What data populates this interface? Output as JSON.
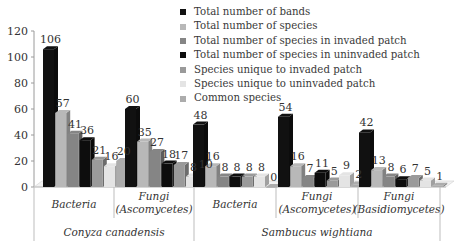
{
  "chart_data": {
    "type": "bar",
    "style": "3d-clustered-column",
    "title": "",
    "xlabel": "",
    "ylabel": "",
    "ylim": [
      0,
      120
    ],
    "yticks": [
      0,
      20,
      40,
      60,
      80,
      100,
      120
    ],
    "grid": false,
    "legend_position": "top-right",
    "group_levels": [
      {
        "label": "Conyza canadensis",
        "categories": [
          "Bacteria",
          "Fungi (Ascomycetes)"
        ]
      },
      {
        "label": "Sambucus wightiana",
        "categories": [
          "Bacteria",
          "Fungi (Ascomycetes)",
          "Fungi (Basidiomycetes)"
        ]
      }
    ],
    "categories": [
      {
        "line1": "Bacteria",
        "line2": ""
      },
      {
        "line1": "Fungi",
        "line2": "(Ascomycetes)"
      },
      {
        "line1": "Bacteria",
        "line2": ""
      },
      {
        "line1": "Fungi",
        "line2": "(Ascomycetes)"
      },
      {
        "line1": "Fungi",
        "line2": "(Basidiomycetes)"
      }
    ],
    "series": [
      {
        "name": "Total number of bands",
        "color": "#111111",
        "values": [
          106,
          60,
          48,
          54,
          42
        ]
      },
      {
        "name": "Total number of species",
        "color": "#b8b8b8",
        "values": [
          57,
          35,
          16,
          16,
          13
        ]
      },
      {
        "name": "Total number of species in invaded patch",
        "color": "#858585",
        "values": [
          41,
          27,
          8,
          7,
          8
        ]
      },
      {
        "name": "Total number of species in uninvaded patch",
        "color": "#0d0d0d",
        "values": [
          36,
          18,
          8,
          11,
          6
        ]
      },
      {
        "name": "Species unique to invaded patch",
        "color": "#9a9a9a",
        "values": [
          21,
          17,
          8,
          5,
          7
        ]
      },
      {
        "name": "Species unique to uninvaded patch",
        "color": "#e4e4e4",
        "values": [
          16,
          8,
          8,
          9,
          5
        ]
      },
      {
        "name": "Common species",
        "color": "#acacac",
        "values": [
          20,
          10,
          0,
          2,
          1
        ]
      }
    ]
  }
}
